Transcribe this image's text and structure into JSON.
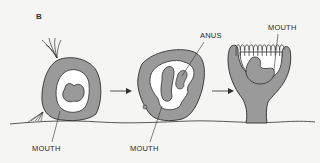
{
  "panel_label": "B",
  "colors": {
    "background": "#f5f5f3",
    "tissue": "#9a9a9a",
    "outline": "#2f2f2f",
    "cavity": "#ffffff"
  },
  "stages": [
    {
      "name": "early",
      "labels": [
        "MOUTH"
      ]
    },
    {
      "name": "middle",
      "labels": [
        "ANUS",
        "MOUTH"
      ]
    },
    {
      "name": "late",
      "labels": [
        "MOUTH"
      ]
    }
  ],
  "labels": {
    "stage1_mouth": "MOUTH",
    "stage2_mouth": "MOUTH",
    "stage2_anus": "ANUS",
    "stage3_mouth": "MOUTH"
  },
  "arrows": [
    "stage1-to-stage2",
    "stage2-to-stage3"
  ]
}
